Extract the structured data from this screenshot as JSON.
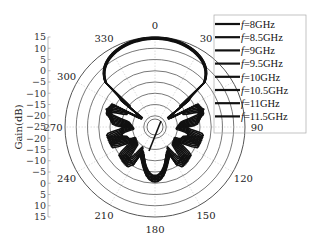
{
  "chart_data": {
    "type": "polar-line",
    "title": "",
    "ylabel": "Gain(dB)",
    "radial_axis": {
      "min": -25,
      "max": 15,
      "ticks": [
        15,
        10,
        5,
        0,
        -5,
        -10,
        -15,
        -20,
        -25,
        -20,
        -15,
        -10,
        -5,
        0,
        5,
        10,
        15
      ],
      "ring_values": [
        15,
        10,
        5,
        0,
        -5,
        -10,
        -15,
        -20
      ]
    },
    "angular_axis": {
      "unit": "deg",
      "direction": "clockwise",
      "zero_at": "top",
      "ticks": [
        0,
        30,
        90,
        120,
        150,
        180,
        210,
        240,
        270,
        300,
        330
      ]
    },
    "legend": {
      "position": "upper-right",
      "entries": [
        "f=8GHz",
        "f=8.5GHz",
        "f=9GHz",
        "f=9.5GHz",
        "f=10GHz",
        "f=10.5GHz",
        "f=11GHz",
        "f=11.5GHz"
      ]
    },
    "series": [
      {
        "name": "f=8GHz",
        "freq_ghz": 8.0,
        "peak_gain_db": 14.0
      },
      {
        "name": "f=8.5GHz",
        "freq_ghz": 8.5,
        "peak_gain_db": 14.2
      },
      {
        "name": "f=9GHz",
        "freq_ghz": 9.0,
        "peak_gain_db": 14.4
      },
      {
        "name": "f=9.5GHz",
        "freq_ghz": 9.5,
        "peak_gain_db": 14.5
      },
      {
        "name": "f=10GHz",
        "freq_ghz": 10.0,
        "peak_gain_db": 14.6
      },
      {
        "name": "f=10.5GHz",
        "freq_ghz": 10.5,
        "peak_gain_db": 14.7
      },
      {
        "name": "f=11GHz",
        "freq_ghz": 11.0,
        "peak_gain_db": 14.8
      },
      {
        "name": "f=11.5GHz",
        "freq_ghz": 11.5,
        "peak_gain_db": 14.9
      }
    ],
    "pattern_shape": {
      "main_lobe_deg": 0,
      "main_lobe_halfwidth_deg": 40,
      "side_lobes_deg": [
        60,
        100,
        130,
        160,
        180
      ],
      "side_lobe_levels_db": [
        -2,
        -6,
        -5,
        -8,
        -4
      ],
      "null_level_db": -24
    },
    "grid": true,
    "line_color": "#111111"
  }
}
